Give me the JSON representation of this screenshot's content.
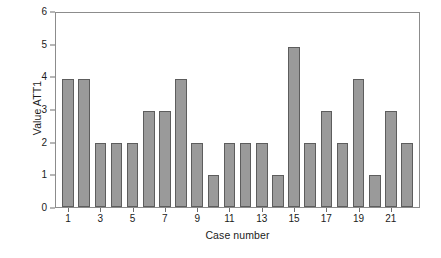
{
  "chart_data": {
    "type": "bar",
    "title": "",
    "subtitle": "",
    "xlabel": "Case number",
    "ylabel": "Value ATT1",
    "categories": [
      1,
      2,
      3,
      4,
      5,
      6,
      7,
      8,
      9,
      10,
      11,
      12,
      13,
      14,
      15,
      16,
      17,
      18,
      19,
      20,
      21,
      22
    ],
    "values": [
      4,
      4,
      2,
      2,
      2,
      3,
      3,
      4,
      2,
      1,
      2,
      2,
      2,
      1,
      5,
      2,
      3,
      2,
      4,
      1,
      3,
      2
    ],
    "ylim": [
      0,
      6
    ],
    "xlim": [
      0.5,
      22.5
    ],
    "y_ticks": [
      0,
      1,
      2,
      3,
      4,
      5,
      6
    ],
    "y_tick_labels": [
      "0",
      "1",
      "2",
      "3",
      "4",
      "5",
      "6"
    ],
    "x_ticks": [
      1,
      3,
      5,
      7,
      9,
      11,
      13,
      15,
      17,
      19,
      21
    ],
    "x_tick_labels": [
      "1",
      "3",
      "5",
      "7",
      "9",
      "11",
      "13",
      "15",
      "17",
      "19",
      "21"
    ],
    "grid": false,
    "legend": null,
    "legend_position": "none",
    "annotations": [],
    "colors": {
      "bar_fill": "#9a9a9a",
      "bar_edge": "#5d5d5d",
      "axis": "#8c8c8c",
      "tick": "#6e6e6e",
      "text": "#1b1b1b",
      "background": "#ffffff"
    }
  }
}
